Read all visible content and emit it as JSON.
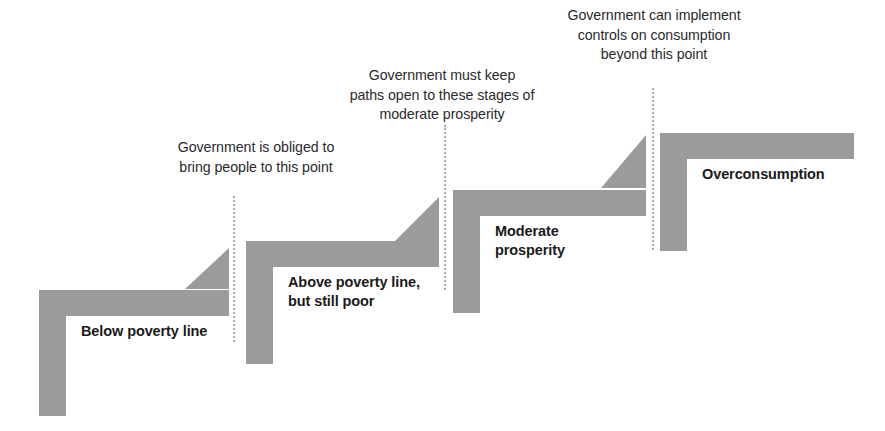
{
  "diagram": {
    "accent_color": "#9a9b9b",
    "guide_color": "#a8a9a9",
    "text_color": "#1a1a1a",
    "note_color": "#2a2a2a",
    "background": "#ffffff",
    "steps": [
      {
        "id": "below-poverty-line",
        "label": "Below poverty line",
        "order": 1
      },
      {
        "id": "above-poverty-line-but-still-poor",
        "label": "Above poverty line,\nbut still poor",
        "order": 2
      },
      {
        "id": "moderate-prosperity",
        "label": "Moderate\nprosperity",
        "order": 3
      },
      {
        "id": "overconsumption",
        "label": "Overconsumption",
        "order": 4
      }
    ],
    "notes": [
      {
        "id": "note-bring-people-to-this-point",
        "text": "Government is obliged to\nbring people to this point",
        "attached_to": "below-poverty-line"
      },
      {
        "id": "note-keep-paths-open",
        "text": "Government must keep\npaths open to these stages of\nmoderate prosperity",
        "attached_to": "above-poverty-line-but-still-poor"
      },
      {
        "id": "note-controls-on-consumption",
        "text": "Government can implement\ncontrols on consumption\nbeyond this point",
        "attached_to": "overconsumption"
      }
    ]
  }
}
